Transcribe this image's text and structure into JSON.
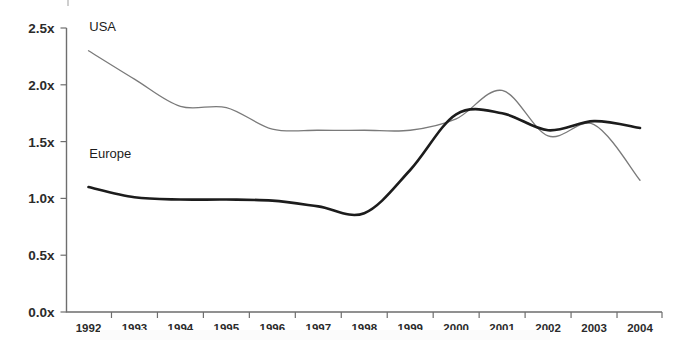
{
  "chart_data": {
    "type": "line",
    "title": "",
    "xlabel": "",
    "ylabel": "",
    "x": [
      1992,
      1993,
      1994,
      1995,
      1996,
      1997,
      1998,
      1999,
      2000,
      2001,
      2002,
      2003,
      2004
    ],
    "categories": [
      "1992",
      "1993",
      "1994",
      "1995",
      "1996",
      "1997",
      "1998",
      "1999",
      "2000",
      "2001",
      "2002",
      "2003",
      "2004"
    ],
    "xlim": [
      1992,
      2004
    ],
    "ylim": [
      0.0,
      2.5
    ],
    "ytick_values": [
      0.0,
      0.5,
      1.0,
      1.5,
      2.0,
      2.5
    ],
    "ytick_labels": [
      "0.0x",
      "0.5x",
      "1.0x",
      "1.5x",
      "2.0x",
      "2.5x"
    ],
    "grid": false,
    "legend_position": "inline-annotations",
    "series": [
      {
        "name": "USA",
        "color": "#7a7a7a",
        "line_width": 1.3,
        "values": [
          2.3,
          2.05,
          1.81,
          1.8,
          1.61,
          1.6,
          1.6,
          1.6,
          1.7,
          1.95,
          1.55,
          1.65,
          1.16
        ]
      },
      {
        "name": "Europe",
        "color": "#1c1c1c",
        "line_width": 2.6,
        "values": [
          1.1,
          1.01,
          0.99,
          0.99,
          0.98,
          0.93,
          0.87,
          1.25,
          1.74,
          1.75,
          1.6,
          1.68,
          1.62
        ]
      }
    ],
    "annotations": [
      {
        "text": "USA",
        "x": 1992.3,
        "y": 2.47
      },
      {
        "text": "Europe",
        "x": 1992.3,
        "y": 1.36
      }
    ]
  }
}
